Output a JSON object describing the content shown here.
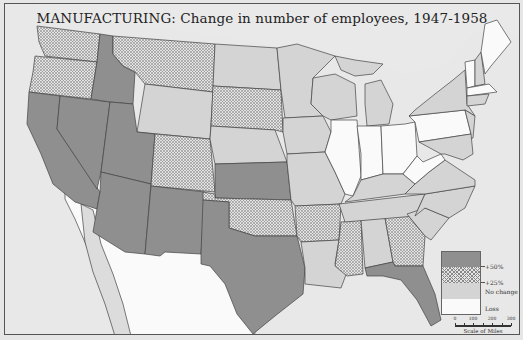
{
  "map": {
    "title": "MANUFACTURING: Change in number of employees, 1947-1958",
    "colors": {
      "increase_50": "#8f8f8f",
      "increase_25_hatch": "#888888",
      "no_change": "#d4d4d4",
      "loss": "#fafafa",
      "water": "#e6e6e6",
      "border": "#444444"
    },
    "legend": {
      "items": [
        {
          "key": "increase_50",
          "label": "+50%"
        },
        {
          "key": "increase_25",
          "label": "+25%"
        },
        {
          "key": "no_change",
          "label": "No change"
        },
        {
          "key": "loss",
          "label": "Loss"
        }
      ]
    },
    "scale": {
      "caption": "Scale of Miles",
      "ticks": [
        "0",
        "100",
        "200",
        "300"
      ]
    },
    "states": {
      "increase_50": [
        "California",
        "Nevada",
        "Idaho",
        "Utah",
        "Arizona",
        "New Mexico",
        "Texas",
        "Kansas",
        "Florida"
      ],
      "increase_25": [
        "Washington",
        "Oregon",
        "Montana",
        "South Dakota",
        "Colorado",
        "Oklahoma",
        "Arkansas",
        "Mississippi",
        "Georgia"
      ],
      "no_change": [
        "Wyoming",
        "North Dakota",
        "Nebraska",
        "Minnesota",
        "Iowa",
        "Missouri",
        "Wisconsin",
        "Michigan",
        "Louisiana",
        "Alabama",
        "Tennessee",
        "Kentucky",
        "Virginia",
        "North Carolina",
        "South Carolina",
        "New York",
        "New Hampshire",
        "New Jersey",
        "Maryland",
        "Delaware",
        "Connecticut"
      ],
      "loss": [
        "Illinois",
        "Indiana",
        "Ohio",
        "Pennsylvania",
        "West Virginia",
        "Maine",
        "Vermont",
        "Massachusetts",
        "Rhode Island"
      ]
    }
  }
}
